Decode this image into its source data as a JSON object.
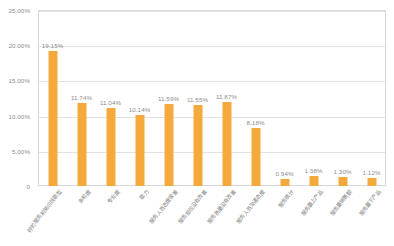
{
  "chart_data": {
    "type": "bar",
    "title": "",
    "subtitle": "",
    "xlabel": "",
    "ylabel": "",
    "ylim": [
      0,
      25
    ],
    "grid": true,
    "legend": false,
    "series_color": "#f5a93c",
    "categories": [
      "好的服务和知识技能型",
      "亲和度",
      "专业度",
      "能力",
      "服务人员态度很差",
      "服务部位没有改善",
      "服务质量没有改善",
      "服务人员沟通态度",
      "服务统计",
      "服务量上产品",
      "服务量销售额",
      "服务量下产品"
    ],
    "values": [
      19.15,
      11.74,
      11.04,
      10.14,
      11.59,
      11.55,
      11.87,
      8.18,
      0.94,
      1.38,
      1.3,
      1.12
    ],
    "value_labels": [
      "19.15%",
      "11.74%",
      "11.04%",
      "10.14%",
      "11.59%",
      "11.55%",
      "11.87%",
      "8.18%",
      "0.94%",
      "1.38%",
      "1.30%",
      "1.12%"
    ],
    "y_ticks": [
      0,
      5,
      10,
      15,
      20,
      25
    ],
    "y_tick_labels": [
      "0",
      "5.00%",
      "10.00%",
      "15.00%",
      "20.00%",
      "25.00%"
    ]
  }
}
